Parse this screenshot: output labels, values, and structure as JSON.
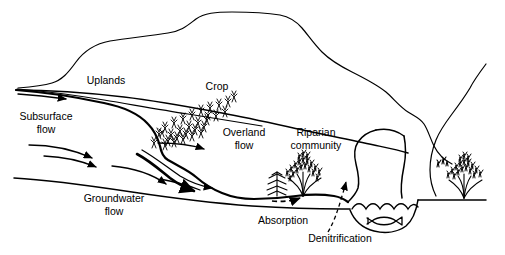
{
  "figure": {
    "background_color": "#ffffff",
    "line_color": "#000000"
  },
  "labels": {
    "uplands": "Uplands",
    "subsurface_flow_line1": "Subsurface",
    "subsurface_flow_line2": "flow",
    "crop": "Crop",
    "overland_flow_line1": "Overland",
    "overland_flow_line2": "flow",
    "riparian_community_line1": "Riparian",
    "riparian_community_line2": "community",
    "groundwater_flow_line1": "Groundwater",
    "groundwater_flow_line2": "flow",
    "absorption": "Absorption",
    "denitrification": "Denitrification"
  },
  "icons": {
    "conifer_tree": "conifer-tree-icon",
    "shrub_left": "riparian-shrub-icon",
    "shrub_right": "riparian-shrub-icon",
    "fish": "fish-icon",
    "crop_field": "crop-field-icon",
    "water_surface": "water-wave-icon"
  },
  "features": [
    {
      "name": "hill-ridge",
      "type": "terrain-outline"
    },
    {
      "name": "upland-soil-surface",
      "type": "terrain-outline"
    },
    {
      "name": "hillslope-soil-boundary",
      "type": "soil-boundary"
    },
    {
      "name": "subsurface-flow-arrow",
      "type": "flow-arrow",
      "label": "Subsurface flow"
    },
    {
      "name": "groundwater-flow-arrow-1",
      "type": "flow-arrow",
      "label": "Groundwater flow"
    },
    {
      "name": "groundwater-flow-arrow-2",
      "type": "flow-arrow",
      "label": "Groundwater flow"
    },
    {
      "name": "groundwater-flow-arrow-3",
      "type": "flow-arrow",
      "label": "Groundwater flow"
    },
    {
      "name": "overland-flow-arrow-1",
      "type": "flow-arrow",
      "label": "Overland flow"
    },
    {
      "name": "overland-flow-arrow-2",
      "type": "flow-arrow",
      "label": "Overland flow"
    },
    {
      "name": "absorption-dashed-arrow",
      "type": "dashed-arrow",
      "label": "Absorption"
    },
    {
      "name": "denitrification-dashed-arrow",
      "type": "dashed-arrow",
      "label": "Denitrification"
    },
    {
      "name": "stream-channel",
      "type": "water-body"
    },
    {
      "name": "crop-field",
      "type": "vegetation"
    },
    {
      "name": "riparian-vegetation",
      "type": "vegetation"
    }
  ]
}
